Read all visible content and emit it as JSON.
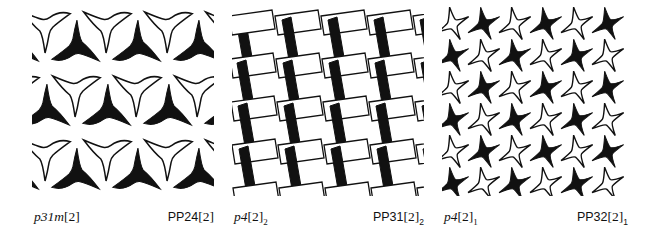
{
  "figure": {
    "background_color": "#ffffff",
    "ink_color": "#111111",
    "panel_count": 3
  },
  "panels": [
    {
      "id": "panel-1",
      "motif": "three-pointed-star",
      "description": "Hexagonal-lattice arrangement of three-pointed concave stars, alternating solid black and white outline, in staggered rows",
      "fill_black": "#111111",
      "fill_white": "#ffffff",
      "stroke_color": "#111111",
      "columns": 4,
      "rows": 4,
      "symmetry_label": {
        "base": "p31m",
        "bracket": "[2]",
        "subscript": ""
      },
      "permutation_label": {
        "base": "PP24",
        "bracket": "[2]",
        "subscript": ""
      }
    },
    {
      "id": "panel-2",
      "motif": "parallelogram-weave",
      "description": "Basket-weave of alternating solid black near-vertical parallelograms and white outlined near-horizontal parallelograms",
      "fill_black": "#111111",
      "fill_white": "#ffffff",
      "stroke_color": "#111111",
      "columns": 5,
      "rows": 6,
      "symmetry_label": {
        "base": "p4",
        "bracket": "[2]",
        "subscript": "2"
      },
      "permutation_label": {
        "base": "PP31",
        "bracket": "[2]",
        "subscript": "2"
      }
    },
    {
      "id": "panel-3",
      "motif": "four-pointed-star",
      "description": "Square-lattice checkerboard of four-pointed concave pinwheel stars alternating solid black and white outline",
      "fill_black": "#111111",
      "fill_white": "#ffffff",
      "stroke_color": "#111111",
      "columns": 6,
      "rows": 6,
      "symmetry_label": {
        "base": "p4",
        "bracket": "[2]",
        "subscript": "1"
      },
      "permutation_label": {
        "base": "PP32",
        "bracket": "[2]",
        "subscript": "1"
      }
    }
  ]
}
